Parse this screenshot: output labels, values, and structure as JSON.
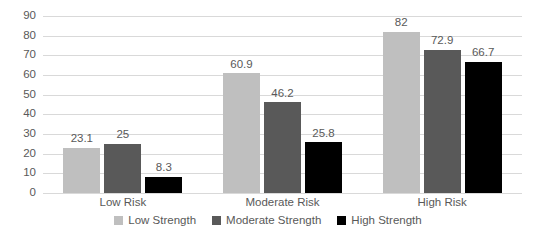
{
  "chart_data": {
    "type": "bar",
    "title": "",
    "subtitle": "",
    "xlabel": "",
    "ylabel": "",
    "categories": [
      "Low Risk",
      "Moderate Risk",
      "High Risk"
    ],
    "series": [
      {
        "name": "Low Strength",
        "color": "#bfbfbf",
        "values": [
          23.1,
          60.9,
          82
        ]
      },
      {
        "name": "Moderate Strength",
        "color": "#595959",
        "values": [
          25,
          46.2,
          72.9
        ]
      },
      {
        "name": "High Strength",
        "color": "#000000",
        "values": [
          8.3,
          25.8,
          66.7
        ]
      }
    ],
    "value_labels": [
      [
        "23.1",
        "25",
        "8.3"
      ],
      [
        "60.9",
        "46.2",
        "25.8"
      ],
      [
        "82",
        "72.9",
        "66.7"
      ]
    ],
    "ylim": [
      0,
      90
    ],
    "ytick_step": 10,
    "ytick_labels": [
      "0",
      "10",
      "20",
      "30",
      "40",
      "50",
      "60",
      "70",
      "80",
      "90"
    ],
    "grid": true,
    "grid_color": "#d9d9d9",
    "legend_position": "bottom",
    "axis_text_color": "#595959",
    "background": "#ffffff"
  },
  "legend": {
    "items": [
      {
        "label": "Low Strength"
      },
      {
        "label": "Moderate Strength"
      },
      {
        "label": "High Strength"
      }
    ]
  }
}
